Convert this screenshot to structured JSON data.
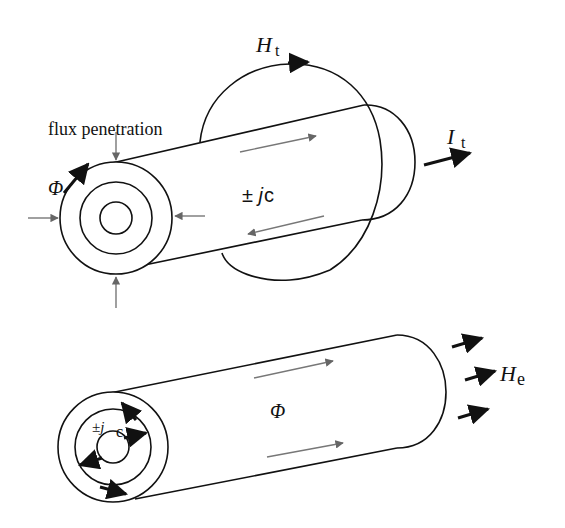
{
  "figure": {
    "top_panel": {
      "labels": {
        "flux_penetration": "flux penetration",
        "phi": "Φ",
        "H_main": "H",
        "H_sub": "t",
        "I_main": "I",
        "I_sub": "t",
        "current_density": "± j",
        "current_density_sub": "c"
      }
    },
    "bottom_panel": {
      "labels": {
        "phi": "Φ",
        "H_main": "H",
        "H_sub": "e",
        "current_density": "±j",
        "current_density_sub": "c"
      }
    },
    "colors": {
      "ink": "#111111",
      "grey_arrow": "#777777",
      "background": "#ffffff"
    }
  }
}
